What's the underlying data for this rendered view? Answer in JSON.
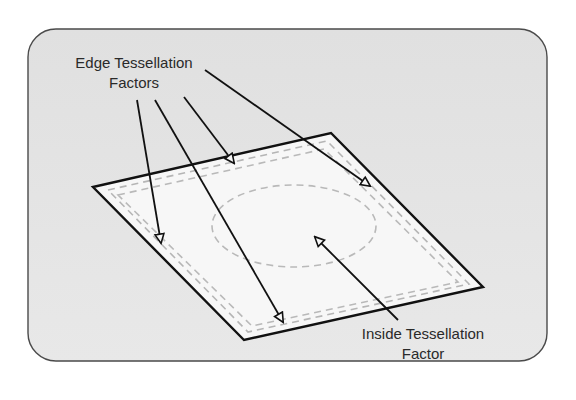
{
  "diagram": {
    "labels": {
      "edge": {
        "line1": "Edge Tessellation",
        "line2": "Factors"
      },
      "inside": {
        "line1": "Inside Tessellation",
        "line2": "Factor"
      }
    },
    "colors": {
      "panel_fill": "#e4e4e4",
      "panel_border": "#4a4a4a",
      "patch_fill": "#f7f7f7",
      "patch_border": "#111111",
      "dashed_lines": "#b5b5b5",
      "arrow": "#111111",
      "text": "#2a2a2a"
    },
    "patch": {
      "corners": {
        "left": [
          93,
          187
        ],
        "top": [
          331,
          133
        ],
        "right": [
          483,
          287
        ],
        "bottom": [
          244,
          340
        ]
      }
    },
    "arrows": {
      "edge": [
        {
          "from": [
            137,
            100
          ],
          "to": [
            161,
            243
          ],
          "target": "left-bottom edge"
        },
        {
          "from": [
            155,
            100
          ],
          "to": [
            283,
            322
          ],
          "target": "bottom edge"
        },
        {
          "from": [
            184,
            97
          ],
          "to": [
            234,
            163
          ],
          "target": "top-left edge"
        },
        {
          "from": [
            205,
            70
          ],
          "to": [
            370,
            186
          ],
          "target": "top-right edge"
        }
      ],
      "inside": [
        {
          "from": [
            398,
            320
          ],
          "to": [
            315,
            237
          ],
          "target": "interior region"
        }
      ]
    }
  }
}
